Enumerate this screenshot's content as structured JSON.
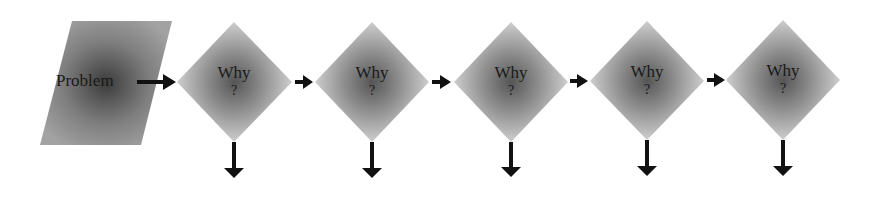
{
  "diagram": {
    "type": "five-whys-flowchart",
    "problem": {
      "label": "Problem",
      "shape": "parallelogram"
    },
    "steps": [
      {
        "label_line1": "Why",
        "label_line2": "?",
        "cx": 234
      },
      {
        "label_line1": "Why",
        "label_line2": "?",
        "cx": 372
      },
      {
        "label_line1": "Why",
        "label_line2": "?",
        "cx": 511
      },
      {
        "label_line1": "Why",
        "label_line2": "?",
        "cx": 647
      },
      {
        "label_line1": "Why",
        "label_line2": "?",
        "cx": 783
      }
    ],
    "colors": {
      "shape_edge": "#d4d4d4",
      "shape_center": "#5a5a5a",
      "problem_edge": "#9a9a9a",
      "problem_center": "#3c3c3c",
      "arrow": "#111111",
      "text": "#1a1a1a"
    }
  }
}
